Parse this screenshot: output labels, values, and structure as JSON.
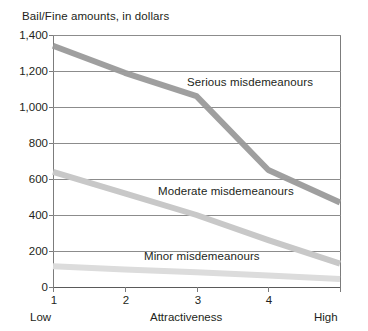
{
  "chart_data": {
    "type": "line",
    "title": "Bail/Fine amounts, in dollars",
    "xlabel": "Attractiveness",
    "ylabel": "",
    "x": [
      1,
      2,
      3,
      4,
      5
    ],
    "x_tick_labels": [
      "1",
      "2",
      "3",
      "4",
      ""
    ],
    "x_low_label": "Low",
    "x_high_label": "High",
    "y_tick_labels": [
      "1,400",
      "1,200",
      "1,000",
      "800",
      "600",
      "400",
      "200",
      "0"
    ],
    "y_ticks": [
      1400,
      1200,
      1000,
      800,
      600,
      400,
      200,
      0
    ],
    "ylim": [
      0,
      1400
    ],
    "grid": "horizontal",
    "legend": "inline-labels",
    "series": [
      {
        "name": "Serious misdemeanours",
        "values": [
          1340,
          1190,
          1060,
          650,
          470
        ],
        "color": "#9a9a9a"
      },
      {
        "name": "Moderate misdemeanours",
        "values": [
          640,
          520,
          400,
          260,
          130
        ],
        "color": "#c8c8c8"
      },
      {
        "name": "Minor misdemeanours",
        "values": [
          115,
          98,
          82,
          64,
          45
        ],
        "color": "#dcdcdc"
      }
    ]
  },
  "labels": {
    "title": "Bail/Fine amounts, in dollars",
    "y_1400": "1,400",
    "y_1200": "1,200",
    "y_1000": "1,000",
    "y_800": "800",
    "y_600": "600",
    "y_400": "400",
    "y_200": "200",
    "y_0": "0",
    "x_1": "1",
    "x_2": "2",
    "x_3": "3",
    "x_4": "4",
    "x_low": "Low",
    "x_high": "High",
    "x_axis_title": "Attractiveness",
    "series_serious": "Serious misdemeanours",
    "series_moderate": "Moderate misdemeanours",
    "series_minor": "Minor misdemeanours"
  },
  "colors": {
    "serious": "#9a9a9a",
    "moderate": "#c8c8c8",
    "minor": "#dcdcdc",
    "axis": "#7c7c7c",
    "grid": "#8c8c8c",
    "text": "#231f20",
    "background": "#ffffff"
  }
}
